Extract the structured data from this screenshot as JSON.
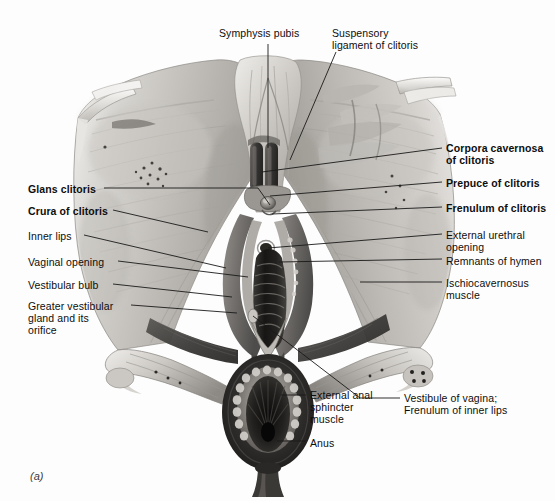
{
  "figure": {
    "caption": "(a)",
    "background_color": "#fdfdfd",
    "ink_color": "#1a1a1a",
    "style": "grayscale anatomical airbrush illustration"
  },
  "labels_top": [
    {
      "name": "symphysis-pubis",
      "text": "Symphysis pubis",
      "bold": false,
      "x": 219,
      "y": 27,
      "align": "left",
      "leader": "M 268 44 L 268 148"
    },
    {
      "name": "suspensory-ligament-of-clitoris",
      "text": "Suspensory\nligament of clitoris",
      "bold": false,
      "x": 332,
      "y": 27,
      "align": "left",
      "leader": "M 336 52 L 290 160"
    }
  ],
  "labels_left": [
    {
      "name": "glans-clitoris",
      "text": "Glans clitoris",
      "bold": true,
      "x": 28,
      "y": 183,
      "leader": "M 104 188 L 258 188 L 270 205"
    },
    {
      "name": "crura-of-clitoris",
      "text": "Crura of clitoris",
      "bold": true,
      "x": 28,
      "y": 205,
      "leader": "M 113 210 L 208 232"
    },
    {
      "name": "inner-lips",
      "text": "Inner lips",
      "bold": false,
      "x": 28,
      "y": 230,
      "leader": "M 84 235 L 226 268"
    },
    {
      "name": "vaginal-opening",
      "text": "Vaginal opening",
      "bold": false,
      "x": 28,
      "y": 256,
      "leader": "M 118 261 L 248 277"
    },
    {
      "name": "vestibular-bulb",
      "text": "Vestibular bulb",
      "bold": false,
      "x": 28,
      "y": 279,
      "leader": "M 113 284 L 232 297"
    },
    {
      "name": "greater-vestibular-gland-and-its-orifice",
      "text": "Greater vestibular\ngland and its\norifice",
      "bold": false,
      "x": 28,
      "y": 300,
      "leader": "M 131 305 L 237 313"
    }
  ],
  "labels_right": [
    {
      "name": "corpora-cavernosa-of-clitoris",
      "text": "Corpora cavernosa\nof clitoris",
      "bold": true,
      "x": 446,
      "y": 142,
      "leader": "M 442 148 L 262 172"
    },
    {
      "name": "prepuce-of-clitoris",
      "text": "Prepuce of clitoris",
      "bold": true,
      "x": 446,
      "y": 177,
      "leader": "M 442 182 L 270 196"
    },
    {
      "name": "frenulum-of-clitoris",
      "text": "Frenulum of clitoris",
      "bold": true,
      "x": 446,
      "y": 202,
      "leader": "M 442 207 L 272 214"
    },
    {
      "name": "external-urethral-opening",
      "text": "External urethral\nopening",
      "bold": false,
      "x": 446,
      "y": 229,
      "leader": "M 442 234 L 268 248"
    },
    {
      "name": "remnants-of-hymen",
      "text": "Remnants of hymen",
      "bold": false,
      "x": 446,
      "y": 255,
      "leader": "M 442 259 L 279 262"
    },
    {
      "name": "ischiocavernosus-muscle",
      "text": "Ischiocavernosus\nmuscle",
      "bold": false,
      "x": 446,
      "y": 277,
      "leader": "M 442 282 L 360 282"
    }
  ],
  "labels_bottom": [
    {
      "name": "external-anal-sphincter-muscle",
      "text": "External anal\nsphincter\nmuscle",
      "bold": false,
      "x": 310,
      "y": 389,
      "leader": "M 306 395 L 281 395"
    },
    {
      "name": "anus",
      "text": "Anus",
      "bold": false,
      "x": 310,
      "y": 437,
      "leader": "M 306 441 L 277 441"
    },
    {
      "name": "vestibule-of-vagina-frenulum-of-inner-lips",
      "text": "Vestibule of vagina;\nFrenulum of inner lips",
      "bold": false,
      "x": 404,
      "y": 392,
      "leader": "M 400 398 L 360 398 L 253 316"
    }
  ]
}
